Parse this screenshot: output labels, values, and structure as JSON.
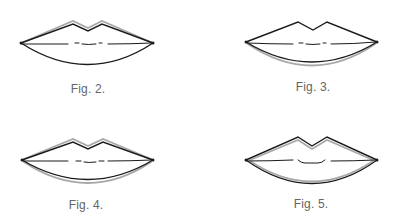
{
  "colors": {
    "outline": "#1a1a1a",
    "shadow_outline": "#a8a8a8",
    "caption": "#666666",
    "background": "#ffffff"
  },
  "figures": [
    {
      "caption": "Fig. 2.",
      "caption_pos": {
        "x": 88,
        "y": 82
      },
      "variant": "upper-lip-gray-above",
      "lips": {
        "left": [
          21,
          43
        ],
        "right": [
          153,
          43
        ],
        "peak_left": [
          73,
          24
        ],
        "peak_right": [
          102,
          24
        ],
        "dip": [
          88,
          31
        ],
        "bottom_y": 64,
        "mouth_y": 44
      }
    },
    {
      "caption": "Fig. 3.",
      "caption_pos": {
        "x": 313,
        "y": 80
      },
      "variant": "lower-lip-gray-below",
      "lips": {
        "left": [
          246,
          42
        ],
        "right": [
          377,
          42
        ],
        "peak_left": [
          298,
          23
        ],
        "peak_right": [
          327,
          23
        ],
        "dip": [
          313,
          30
        ],
        "bottom_y": 62,
        "mouth_y": 44
      }
    },
    {
      "caption": "Fig. 4.",
      "caption_pos": {
        "x": 86,
        "y": 198
      },
      "variant": "both-lips-gray-outside",
      "lips": {
        "left": [
          22,
          160
        ],
        "right": [
          153,
          160
        ],
        "peak_left": [
          73,
          142
        ],
        "peak_right": [
          103,
          142
        ],
        "dip": [
          88,
          149
        ],
        "bottom_y": 179,
        "mouth_y": 161
      }
    },
    {
      "caption": "Fig. 5.",
      "caption_pos": {
        "x": 311,
        "y": 197
      },
      "variant": "both-lips-gray-inside",
      "lips": {
        "left": [
          246,
          160
        ],
        "right": [
          377,
          160
        ],
        "peak_left": [
          298,
          138
        ],
        "peak_right": [
          327,
          138
        ],
        "dip": [
          312,
          147
        ],
        "bottom_y": 183,
        "mouth_y": 161
      }
    }
  ]
}
